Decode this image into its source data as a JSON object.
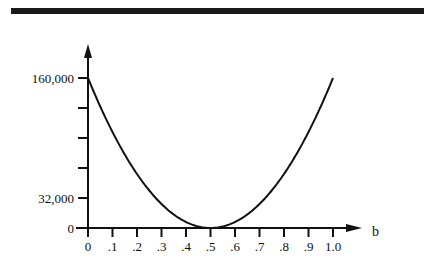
{
  "chart_data": {
    "type": "line",
    "title": "",
    "xlabel": "b",
    "ylabel": "",
    "xlim": [
      0,
      1.0
    ],
    "ylim": [
      0,
      160000
    ],
    "x_ticks": [
      0,
      0.1,
      0.2,
      0.3,
      0.4,
      0.5,
      0.6,
      0.7,
      0.8,
      0.9,
      1.0
    ],
    "x_tick_labels": [
      "0",
      ".1",
      ".2",
      ".3",
      ".4",
      ".5",
      ".6",
      ".7",
      ".8",
      ".9",
      "1.0"
    ],
    "y_ticks": [
      0,
      32000,
      64000,
      96000,
      128000,
      160000
    ],
    "y_tick_labels": [
      "0",
      "32,000",
      "",
      "",
      "",
      "160,000"
    ],
    "grid": false,
    "legend": "none",
    "series": [
      {
        "name": "parabola",
        "description": "U-shaped curve with minimum 0 at b = .5",
        "x": [
          0,
          0.05,
          0.1,
          0.15,
          0.2,
          0.25,
          0.3,
          0.35,
          0.4,
          0.45,
          0.5,
          0.55,
          0.6,
          0.65,
          0.7,
          0.75,
          0.8,
          0.85,
          0.9,
          0.95,
          1.0
        ],
        "y": [
          160000,
          129600,
          102400,
          78400,
          57600,
          40000,
          25600,
          14400,
          6400,
          1600,
          0,
          1600,
          6400,
          14400,
          25600,
          40000,
          57600,
          78400,
          102400,
          129600,
          160000
        ]
      }
    ]
  }
}
